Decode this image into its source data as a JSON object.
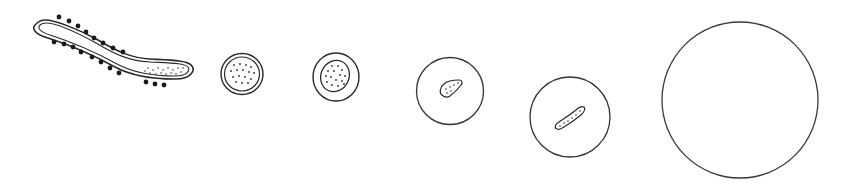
{
  "figure": {
    "description": "Sequence of six hand-drawn cell stages, left to right: elongated spiked rod, double-walled dotted sphere, walled sphere with dotted nucleus, thin circle with small dotted body, larger circle with elongated dotted body, large empty circle",
    "stroke_color": "#333333",
    "background_color": "#ffffff",
    "stages": [
      {
        "id": 1,
        "label": "elongated-spiked-cell",
        "shape": "rod",
        "has_spikes": true,
        "dotted_interior": true
      },
      {
        "id": 2,
        "label": "double-walled-dotted-cell",
        "shape": "circle",
        "cx": 242,
        "cy": 74,
        "r": 21
      },
      {
        "id": 3,
        "label": "walled-cell-with-nucleus",
        "shape": "circle",
        "cx": 336,
        "cy": 77,
        "r": 23
      },
      {
        "id": 4,
        "label": "circle-with-small-body",
        "shape": "circle",
        "cx": 450,
        "cy": 91,
        "r": 34
      },
      {
        "id": 5,
        "label": "circle-with-rod-body",
        "shape": "circle",
        "cx": 570,
        "cy": 117,
        "r": 40
      },
      {
        "id": 6,
        "label": "large-empty-circle",
        "shape": "circle",
        "cx": 740,
        "cy": 100,
        "r": 78
      }
    ]
  }
}
